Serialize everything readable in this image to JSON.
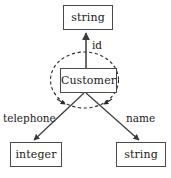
{
  "diagram": {
    "type": "entity-attribute-graph",
    "colors": {
      "background": "#ffffff",
      "box_stroke": "#4a4a4a",
      "box_fill": "#ffffff",
      "edge_stroke": "#3a3a3a",
      "dashed_ellipse_stroke": "#2a2a2a",
      "text": "#1a1a1a"
    },
    "nodes": [
      {
        "id": "string_top",
        "label": "string",
        "shape": "rectangle",
        "x": 63,
        "y": 5,
        "width": 50,
        "height": 25
      },
      {
        "id": "customer",
        "label": "Customer",
        "shape": "rectangle",
        "x": 60,
        "y": 68,
        "width": 57,
        "height": 25
      },
      {
        "id": "integer",
        "label": "integer",
        "shape": "rectangle",
        "x": 10,
        "y": 142,
        "width": 52,
        "height": 25
      },
      {
        "id": "string_bottom",
        "label": "string",
        "shape": "rectangle",
        "x": 116,
        "y": 142,
        "width": 50,
        "height": 25
      }
    ],
    "edges": [
      {
        "id": "edge_id",
        "label": "id",
        "from": "customer",
        "to": "string_top",
        "style": "solid",
        "arrow": "up"
      },
      {
        "id": "edge_telephone",
        "label": "telephone",
        "from": "customer",
        "to": "integer",
        "style": "solid",
        "arrow": "down-left"
      },
      {
        "id": "edge_name",
        "label": "name",
        "from": "customer",
        "to": "string_bottom",
        "style": "solid",
        "arrow": "down-right"
      }
    ],
    "annotation": {
      "id": "self_loop_ellipse",
      "shape": "ellipse",
      "style": "dashed",
      "label": "",
      "cx": 84.5,
      "cy": 80,
      "rx": 34,
      "ry": 28,
      "arrowheads": 2
    }
  }
}
